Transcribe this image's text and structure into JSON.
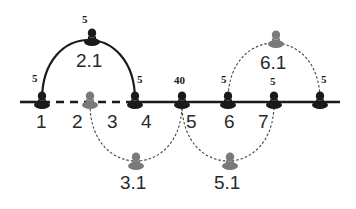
{
  "diagram": {
    "main_line": {
      "x1": 20,
      "x2": 340,
      "y": 102,
      "dashed_segment": [
        42,
        135
      ]
    },
    "colors": {
      "primary": "#1a1a1a",
      "secondary": "#7a7a7a"
    },
    "nodes": [
      {
        "id": "n1",
        "label": "1",
        "x": 42,
        "capacity": "5",
        "color": "primary"
      },
      {
        "id": "n2",
        "label": "2",
        "x": 90,
        "capacity": "",
        "color": "secondary"
      },
      {
        "id": "n3",
        "label": "3",
        "x": 112,
        "capacity": "",
        "color": "none"
      },
      {
        "id": "n4",
        "label": "4",
        "x": 135,
        "capacity": "5",
        "color": "primary"
      },
      {
        "id": "n5",
        "label": "5",
        "x": 182,
        "capacity": "40",
        "color": "primary"
      },
      {
        "id": "n6",
        "label": "6",
        "x": 228,
        "capacity": "5",
        "color": "primary"
      },
      {
        "id": "n7",
        "label": "7",
        "x": 274,
        "capacity": "5",
        "color": "primary"
      },
      {
        "id": "n8",
        "label": "",
        "x": 320,
        "capacity": "5",
        "color": "primary"
      }
    ],
    "branches": [
      {
        "id": "b21",
        "label": "2.1",
        "capacity": "5",
        "from": 42,
        "to": 135,
        "direction": "up",
        "style": "solid"
      },
      {
        "id": "b61",
        "label": "6.1",
        "capacity": "",
        "from": 228,
        "to": 320,
        "direction": "up",
        "style": "dashed"
      },
      {
        "id": "b31",
        "label": "3.1",
        "capacity": "",
        "from": 90,
        "to": 182,
        "direction": "down",
        "style": "dashed"
      },
      {
        "id": "b51",
        "label": "5.1",
        "capacity": "",
        "from": 182,
        "to": 274,
        "direction": "down",
        "style": "dashed"
      }
    ]
  }
}
